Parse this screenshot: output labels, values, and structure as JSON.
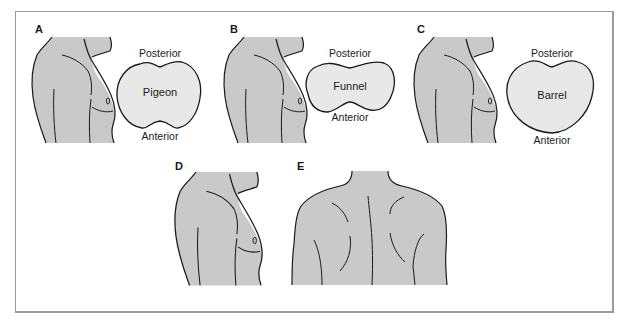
{
  "figure": {
    "panels": [
      {
        "id": "A",
        "label": "A",
        "shape_name": "Pigeon",
        "top_label": "Posterior",
        "bottom_label": "Anterior"
      },
      {
        "id": "B",
        "label": "B",
        "shape_name": "Funnel",
        "top_label": "Posterior",
        "bottom_label": "Anterior"
      },
      {
        "id": "C",
        "label": "C",
        "shape_name": "Barrel",
        "top_label": "Posterior",
        "bottom_label": "Anterior"
      },
      {
        "id": "D",
        "label": "D"
      },
      {
        "id": "E",
        "label": "E"
      }
    ],
    "colors": {
      "torso_fill": "#c9c9c9",
      "section_fill": "#e8e8e8",
      "outline": "#1a1a1a",
      "frame": "#9a9a9a"
    }
  }
}
